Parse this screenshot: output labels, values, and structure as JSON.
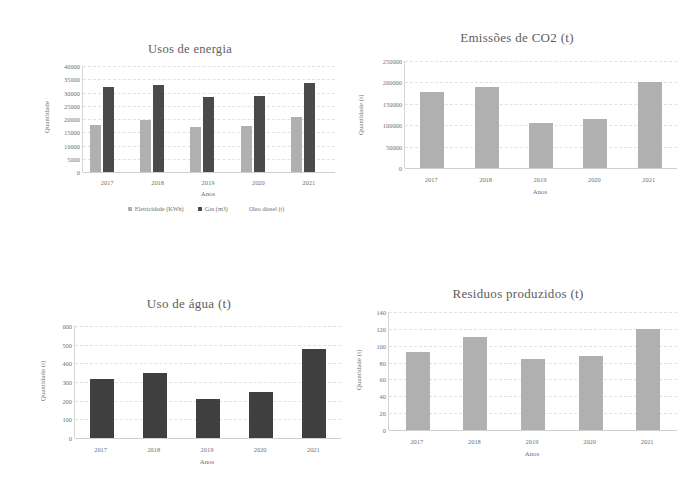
{
  "page": {
    "background": "#ffffff",
    "text_color": "#5d5d5d"
  },
  "colors": {
    "series_light": "#b0b0b0",
    "series_dark": "#4a4a4a",
    "series_third": "#ffffff",
    "grid": "#e2e2e2",
    "axis": "#cfcfcf"
  },
  "chart_data": [
    {
      "id": "usos-de-energia",
      "type": "bar",
      "title": "Usos de energia",
      "xlabel": "Anos",
      "ylabel": "Quantidade",
      "categories": [
        "2017",
        "2018",
        "2019",
        "2020",
        "2021"
      ],
      "yticks": [
        "40000",
        "35000",
        "30000",
        "25000",
        "20000",
        "15000",
        "10000",
        "5000",
        "0"
      ],
      "ylim": [
        0,
        40000
      ],
      "grid": true,
      "legend_position": "bottom",
      "series": [
        {
          "name": "Eletricidade (KWh)",
          "color": "#b0b0b0",
          "values": [
            17700,
            19700,
            16800,
            17200,
            20600
          ]
        },
        {
          "name": "Gas (m3)",
          "color": "#4a4a4a",
          "values": [
            32000,
            32900,
            28200,
            28500,
            33600
          ]
        },
        {
          "name": "Oleo diesel (t)",
          "color": "#ffffff",
          "values": [
            0,
            0,
            0,
            0,
            0
          ]
        }
      ]
    },
    {
      "id": "emissoes-de-co2",
      "type": "bar",
      "title": "Emissões de CO2 (t)",
      "xlabel": "Anos",
      "ylabel": "Quantidade (t)",
      "categories": [
        "2017",
        "2018",
        "2019",
        "2020",
        "2021"
      ],
      "yticks": [
        "250000",
        "200000",
        "150000",
        "100000",
        "50000",
        "0"
      ],
      "ylim": [
        0,
        250000
      ],
      "grid": true,
      "legend_position": "none",
      "series": [
        {
          "name": "Emissões de CO2",
          "color": "#b0b0b0",
          "values": [
            178000,
            189000,
            105000,
            115000,
            202000
          ]
        }
      ]
    },
    {
      "id": "uso-de-agua",
      "type": "bar",
      "title": "Uso de água (t)",
      "xlabel": "Anos",
      "ylabel": "Quantidade (t)",
      "categories": [
        "2017",
        "2018",
        "2019",
        "2020",
        "2021"
      ],
      "yticks": [
        "600",
        "500",
        "400",
        "300",
        "200",
        "100",
        "0"
      ],
      "ylim": [
        0,
        600
      ],
      "grid": true,
      "legend_position": "none",
      "series": [
        {
          "name": "Uso de água",
          "color": "#3f3f3f",
          "values": [
            315,
            348,
            210,
            245,
            478
          ]
        }
      ]
    },
    {
      "id": "residuos-produzidos",
      "type": "bar",
      "title": "Residuos produzidos (t)",
      "xlabel": "Anos",
      "ylabel": "Quantidade (t)",
      "categories": [
        "2017",
        "2018",
        "2019",
        "2020",
        "2021"
      ],
      "yticks": [
        "140",
        "120",
        "100",
        "80",
        "60",
        "40",
        "20",
        "0"
      ],
      "ylim": [
        0,
        140
      ],
      "grid": true,
      "legend_position": "none",
      "series": [
        {
          "name": "Residuos produzidos",
          "color": "#b0b0b0",
          "values": [
            93,
            110,
            84,
            88,
            120
          ]
        }
      ]
    }
  ]
}
